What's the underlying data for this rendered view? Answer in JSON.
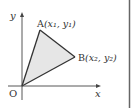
{
  "diagram": {
    "axis_x_label": "x",
    "axis_y_label": "y",
    "origin_label": "O",
    "point_a": {
      "name": "A",
      "coords_label": "(x₁, y₁)"
    },
    "point_b": {
      "name": "B",
      "coords_label": "(x₂, y₂)"
    },
    "triangle": [
      "O",
      "A",
      "B"
    ],
    "fill_color": "#e6e6e6",
    "line_color": "#333333"
  }
}
